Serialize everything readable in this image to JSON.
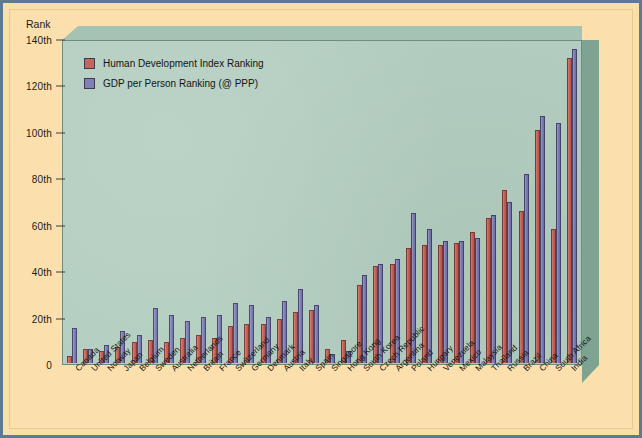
{
  "axis": {
    "y_title": "Rank",
    "y_ticks": [
      "0",
      "20th",
      "40th",
      "60th",
      "80th",
      "100th",
      "120th",
      "140th"
    ]
  },
  "legend": {
    "items": [
      {
        "label": "Human Development Index Ranking",
        "color": "#c8655a",
        "swatch": "hdi"
      },
      {
        "label": "GDP per Person Ranking (@ PPP)",
        "color": "#8080b8",
        "swatch": "gdp"
      }
    ]
  },
  "colors": {
    "hdi": "#c8655a",
    "gdp": "#8080b8",
    "plot_bg": "#b3cec0",
    "page_bg": "#fbe0ad",
    "frame": "#5d7a93"
  },
  "chart_data": {
    "type": "bar",
    "title": "",
    "xlabel": "",
    "ylabel": "Rank",
    "ylim": [
      0,
      140
    ],
    "grid": false,
    "legend_position": "top-left",
    "categories": [
      "Canada",
      "United States",
      "Norway",
      "Japan",
      "Belgium",
      "Sweden",
      "Australia",
      "Netherlands",
      "Britain",
      "France",
      "Switzerland",
      "Germany",
      "Denmark",
      "Austria",
      "Italy",
      "Spain",
      "Singapore",
      "Hong Kong",
      "South Korea",
      "Czech Republic",
      "Argentina",
      "Poland",
      "Hungary",
      "Venezuela",
      "Mexico",
      "Malaysia",
      "Thailand",
      "Russia",
      "Brazil",
      "China",
      "South Africa",
      "India"
    ],
    "series": [
      {
        "name": "Human Development Index Ranking",
        "color": "#c8655a",
        "values": [
          3,
          6,
          5,
          7,
          9,
          10,
          9,
          11,
          12,
          11,
          16,
          17,
          17,
          19,
          22,
          23,
          6,
          10,
          34,
          42,
          43,
          50,
          51,
          51,
          52,
          57,
          63,
          75,
          66,
          101,
          58,
          132
        ]
      },
      {
        "name": "GDP per Person Ranking (@ PPP)",
        "color": "#8080b8",
        "values": [
          15,
          6,
          8,
          14,
          12,
          24,
          21,
          18,
          20,
          21,
          26,
          25,
          20,
          27,
          32,
          25,
          4,
          5,
          38,
          43,
          45,
          65,
          58,
          53,
          53,
          54,
          64,
          70,
          82,
          107,
          104,
          136
        ]
      }
    ]
  }
}
